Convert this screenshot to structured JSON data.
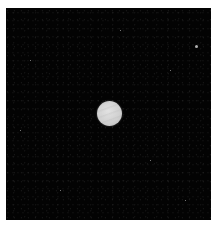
{
  "image": {
    "subject": "planet",
    "background_color": "#030303",
    "border_color": "#ffffff",
    "planet": {
      "color": "#cfcfcf",
      "center": [
        109,
        114
      ],
      "diameter": 25
    },
    "stars": [
      {
        "x": 196,
        "y": 46,
        "size": 3
      },
      {
        "x": 170,
        "y": 70,
        "size": 1
      },
      {
        "x": 30,
        "y": 60,
        "size": 1
      },
      {
        "x": 60,
        "y": 190,
        "size": 1
      },
      {
        "x": 150,
        "y": 160,
        "size": 1
      },
      {
        "x": 20,
        "y": 130,
        "size": 1
      },
      {
        "x": 120,
        "y": 30,
        "size": 1
      },
      {
        "x": 185,
        "y": 200,
        "size": 1
      }
    ]
  }
}
